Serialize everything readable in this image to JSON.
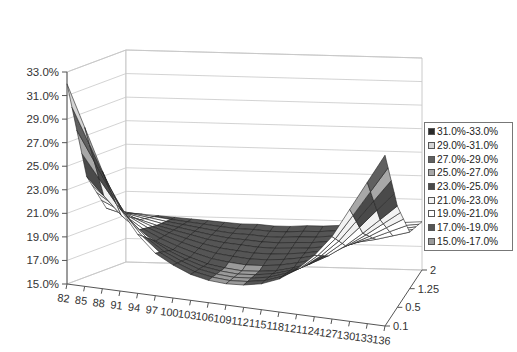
{
  "chart_data": {
    "type": "surface3d",
    "title": "",
    "xlabel": "",
    "ylabel": "",
    "zlabel": "",
    "value_axis": {
      "min": 15.0,
      "max": 33.0,
      "step": 2.0,
      "tick_labels": [
        "33.0%",
        "31.0%",
        "29.0%",
        "27.0%",
        "25.0%",
        "23.0%",
        "21.0%",
        "19.0%",
        "17.0%",
        "15.0%"
      ]
    },
    "categories": [
      "82",
      "85",
      "88",
      "91",
      "94",
      "97",
      "100",
      "103",
      "106",
      "109",
      "112",
      "115",
      "118",
      "121",
      "124",
      "127",
      "130",
      "133",
      "136"
    ],
    "series_axis": [
      "0.1",
      "0.5",
      "1.25",
      "2"
    ],
    "series": [
      {
        "name": "0.1",
        "values": [
          32.0,
          28.5,
          25.0,
          22.0,
          20.0,
          18.6,
          17.8,
          17.2,
          16.9,
          16.8,
          16.9,
          17.2,
          17.8,
          18.8,
          20.2,
          22.0,
          24.5,
          27.0,
          29.5
        ]
      },
      {
        "name": "0.5",
        "values": [
          23.5,
          22.0,
          20.5,
          19.4,
          18.6,
          18.0,
          17.5,
          17.1,
          16.9,
          16.8,
          16.9,
          17.1,
          17.5,
          18.0,
          18.8,
          19.8,
          21.0,
          22.3,
          23.6
        ]
      },
      {
        "name": "1.25",
        "values": [
          20.2,
          19.8,
          19.4,
          19.0,
          18.7,
          18.4,
          18.1,
          17.9,
          17.8,
          17.7,
          17.7,
          17.8,
          17.9,
          18.1,
          18.4,
          18.7,
          19.0,
          19.4,
          19.8
        ]
      },
      {
        "name": "2",
        "values": [
          19.2,
          19.1,
          19.0,
          18.9,
          18.8,
          18.7,
          18.6,
          18.5,
          18.5,
          18.4,
          18.4,
          18.5,
          18.5,
          18.6,
          18.7,
          18.8,
          18.9,
          19.0,
          19.1
        ]
      }
    ],
    "legend_position": "right",
    "grid": true
  },
  "legend": {
    "items": [
      {
        "label": "31.0%-33.0%",
        "color": "#2a2a2a"
      },
      {
        "label": "29.0%-31.0%",
        "color": "#d4d4d4"
      },
      {
        "label": "27.0%-29.0%",
        "color": "#606060"
      },
      {
        "label": "25.0%-27.0%",
        "color": "#a8a8a8"
      },
      {
        "label": "23.0%-25.0%",
        "color": "#4a4a4a"
      },
      {
        "label": "21.0%-23.0%",
        "color": "#f2f2f2"
      },
      {
        "label": "19.0%-21.0%",
        "color": "#ffffff"
      },
      {
        "label": "17.0%-19.0%",
        "color": "#555555"
      },
      {
        "label": "15.0%-17.0%",
        "color": "#9a9a9a"
      }
    ]
  }
}
